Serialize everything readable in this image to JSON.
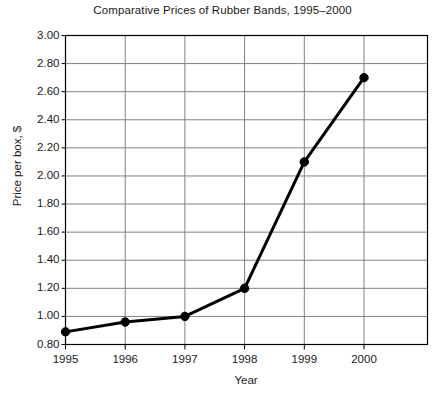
{
  "chart_data": {
    "type": "line",
    "title": "Comparative Prices of Rubber Bands, 1995–2000",
    "xlabel": "Year",
    "ylabel": "Price per box, $",
    "categories": [
      "1995",
      "1996",
      "1997",
      "1998",
      "1999",
      "2000"
    ],
    "values": [
      0.89,
      0.96,
      1.0,
      1.2,
      2.1,
      2.7
    ],
    "series": [
      {
        "name": "Price per box",
        "values": [
          0.89,
          0.96,
          1.0,
          1.2,
          2.1,
          2.7
        ]
      }
    ],
    "ylim": [
      0.8,
      3.0
    ],
    "ytick_step": 0.2,
    "ytick_labels": [
      "3.00",
      "2.80",
      "2.60",
      "2.40",
      "2.20",
      "2.00",
      "1.80",
      "1.60",
      "1.40",
      "1.20",
      "1.00",
      "0.80"
    ],
    "xtick_labels": [
      "1995",
      "1996",
      "1997",
      "1998",
      "1999",
      "2000"
    ],
    "grid": true,
    "grid_color": "#808080",
    "legend": "none",
    "line_color": "#000000",
    "marker": "circle",
    "marker_color": "#000000",
    "axis_color": "#000000",
    "background_color": "#ffffff"
  }
}
